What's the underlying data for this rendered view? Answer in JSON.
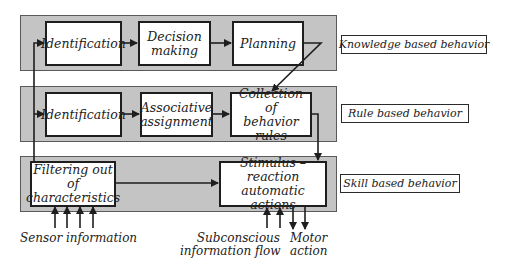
{
  "diagram": {
    "levels": [
      {
        "name": "knowledge",
        "label": "Knowledge based behavior",
        "boxes": [
          {
            "text": "Identification"
          },
          {
            "text": "Decision making",
            "lines": [
              "Decision",
              "making"
            ]
          },
          {
            "text": "Planning"
          }
        ]
      },
      {
        "name": "rule",
        "label": "Rule based behavior",
        "boxes": [
          {
            "text": "Identification"
          },
          {
            "text": "Associative assignment",
            "lines": [
              "Associative",
              "assignment"
            ]
          },
          {
            "text": "Collection of behavior rules",
            "lines": [
              "Collection of",
              "behavior rules"
            ]
          }
        ]
      },
      {
        "name": "skill",
        "label": "Skill based behavior",
        "boxes": [
          {
            "text": "Filtering out of characteristics",
            "lines": [
              "Filtering out of",
              "characteristics"
            ]
          },
          {
            "text": "Stimulus – reaction automatic actions",
            "lines": [
              "Stimulus – reaction",
              "automatic actions"
            ]
          }
        ]
      }
    ],
    "captions": {
      "sensor": "Sensor information",
      "subconscious": [
        "Subconscious",
        "information flow"
      ],
      "motor": [
        "Motor",
        "action"
      ]
    },
    "colors": {
      "panel": "#c4c4c4",
      "box_border": "#1e1e1e",
      "arrow": "#1e1e1e",
      "background": "#ffffff"
    }
  }
}
